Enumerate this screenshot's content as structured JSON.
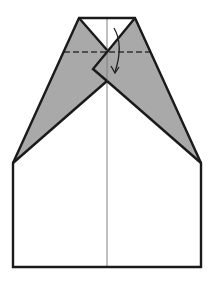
{
  "diagram": {
    "colors": {
      "background": "#ffffff",
      "paper": "#ffffff",
      "shaded_flap": "#a9a9a9",
      "outline": "#1a1a1a",
      "center_crease": "#808080",
      "fold_line": "#333333"
    },
    "elements": {
      "outline": "Paper outline with pointed top and rectangular base",
      "left_flap": "Shaded left folded flap",
      "right_flap": "Shaded right folded flap",
      "center_crease": "Vertical center crease",
      "valley_fold_line": "Dashed horizontal fold line",
      "fold_arrow": "Curved arrow indicating fold down"
    }
  }
}
